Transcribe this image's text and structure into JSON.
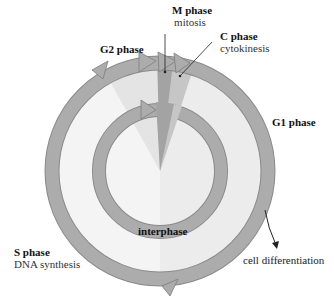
{
  "phases": {
    "m": {
      "name": "M phase",
      "desc": "mitosis"
    },
    "c": {
      "name": "C phase",
      "desc": "cytokinesis"
    },
    "g2": {
      "name": "G2 phase"
    },
    "g1": {
      "name": "G1 phase"
    },
    "s": {
      "name": "S phase",
      "desc": "DNA synthesis"
    }
  },
  "center_label": "interphase",
  "exit_label": "cell differentiation",
  "colors": {
    "ring": "#a9a9a9",
    "ring_stroke": "#8a8a8a",
    "m_wedge": "#a0a0a0",
    "c_wedge": "#c4c4c4",
    "g2_sector": "#e6e6e6",
    "g1_sector": "#ececec",
    "s_sector": "#f4f4f4"
  }
}
